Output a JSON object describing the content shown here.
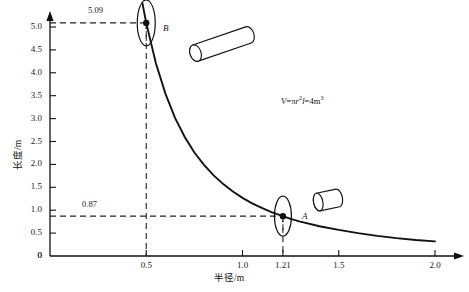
{
  "chart_data": {
    "type": "line",
    "title": "",
    "xlabel": "半径/m",
    "ylabel": "长度/m",
    "xlim": [
      0,
      2.0
    ],
    "ylim": [
      0,
      5.3
    ],
    "grid": false,
    "legend": "none",
    "annotation_formula": "V=πr²l=4m³",
    "formula_parts": {
      "v": "V",
      "eq1": "=",
      "pi": "π",
      "r": "r",
      "sup2": "2",
      "l": "l",
      "eq2": "=4",
      "unit": "m",
      "sup3": "3"
    },
    "curve_equation": "l = 4/(π r²)",
    "curve_volume": 4,
    "x_ticks": [
      {
        "value": 0,
        "label": "0"
      },
      {
        "value": 0.5,
        "label": "0.5"
      },
      {
        "value": 1.0,
        "label": "1.0"
      },
      {
        "value": 1.21,
        "label": "1.21"
      },
      {
        "value": 1.5,
        "label": "1.5"
      },
      {
        "value": 2.0,
        "label": "2.0"
      }
    ],
    "y_ticks": [
      {
        "value": 0,
        "label": "0"
      },
      {
        "value": 0.5,
        "label": "0.5"
      },
      {
        "value": 1.0,
        "label": "1.0"
      },
      {
        "value": 1.5,
        "label": "1.5"
      },
      {
        "value": 2.0,
        "label": "2.0"
      },
      {
        "value": 2.5,
        "label": "2.5"
      },
      {
        "value": 3.0,
        "label": "3.0"
      },
      {
        "value": 3.5,
        "label": "3.5"
      },
      {
        "value": 4.0,
        "label": "4.0"
      },
      {
        "value": 4.5,
        "label": "4.5"
      },
      {
        "value": 5.0,
        "label": "5.0"
      }
    ],
    "points": [
      {
        "name": "B",
        "x": 0.5,
        "y": 5.09,
        "x_label": "0.5",
        "y_label": "5.09",
        "shape": "tall-thin-cylinder"
      },
      {
        "name": "A",
        "x": 1.21,
        "y": 0.87,
        "x_label": "1.21",
        "y_label": "0.87",
        "shape": "short-wide-cylinder"
      }
    ],
    "series": [
      {
        "name": "l = 4/(πr²)",
        "x": [
          0.48,
          0.5,
          0.55,
          0.6,
          0.65,
          0.7,
          0.75,
          0.8,
          0.85,
          0.9,
          0.95,
          1.0,
          1.05,
          1.1,
          1.15,
          1.21,
          1.25,
          1.3,
          1.4,
          1.5,
          1.6,
          1.7,
          1.8,
          1.9,
          2.0
        ],
        "values": [
          5.52,
          5.09,
          4.21,
          3.54,
          3.01,
          2.6,
          2.26,
          1.99,
          1.76,
          1.57,
          1.41,
          1.27,
          1.15,
          1.05,
          0.96,
          0.87,
          0.81,
          0.75,
          0.65,
          0.57,
          0.5,
          0.44,
          0.39,
          0.35,
          0.32
        ]
      }
    ],
    "dashed_guides": [
      {
        "for": "B",
        "horizontal_from_y_axis_label": "5.09",
        "vertical_to_x_axis_label": "0.5"
      },
      {
        "for": "A",
        "horizontal_from_y_axis_label": "0.87",
        "vertical_to_x_axis_label": "1.21"
      }
    ],
    "pictograms": [
      {
        "name": "cylinder-tall-near-B",
        "style": "elongated tilted 3D cylinder"
      },
      {
        "name": "cylinder-short-near-A",
        "style": "short squat 3D cylinder"
      }
    ]
  }
}
